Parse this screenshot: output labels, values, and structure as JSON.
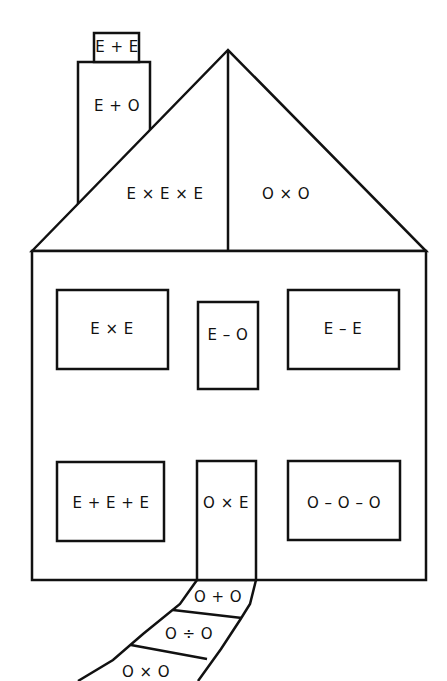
{
  "diagram": {
    "type": "house-of-expressions",
    "colors": {
      "line": "#111111",
      "background": "#ffffff"
    },
    "labels": {
      "chimney_cap": "E + E",
      "chimney": "E + O",
      "roof_left": "E × E × E",
      "roof_right": "O × O",
      "window_top_left": "E × E",
      "window_top_center": "E – O",
      "window_top_right": "E – E",
      "window_bottom_left": "E + E + E",
      "door": "O × E",
      "window_bottom_right": "O – O – O",
      "path_step_1": "O + O",
      "path_step_2": "O ÷ O",
      "path_step_3": "O × O"
    }
  }
}
